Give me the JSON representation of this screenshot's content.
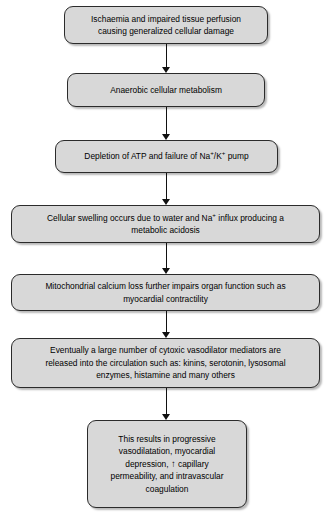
{
  "diagram": {
    "type": "vertical-flowchart",
    "orientation": "top-to-bottom",
    "box_fill_color": "#d8d8d8",
    "box_border_color": "#2b2b2b",
    "text_color": "#000000",
    "arrow_color": "#111111",
    "background_color": "#ffffff",
    "nodes": [
      {
        "id": "node-1",
        "text": "Ischaemia and impaired tissue perfusion\ncausing generalized cellular damage",
        "lines": 2
      },
      {
        "id": "node-2",
        "text": "Anaerobic cellular metabolism",
        "lines": 1
      },
      {
        "id": "node-3",
        "text_before": "Depletion of ATP and failure of Na",
        "sup_1": "+",
        "text_middle": "/K",
        "sup_2": "+",
        "text_after": " pump",
        "text": "Depletion of ATP and failure of Na+/K+ pump",
        "lines": 1
      },
      {
        "id": "node-4",
        "text_before": "Cellular swelling occurs due to water and Na",
        "sup_1": "+",
        "text_after": " influx producing a\nmetabolic acidosis",
        "text": "Cellular swelling occurs due to water and Na+ influx producing a metabolic acidosis",
        "lines": 2
      },
      {
        "id": "node-5",
        "text": "Mitochondrial calcium loss further impairs organ function such as\nmyocardial contractility",
        "lines": 2
      },
      {
        "id": "node-6",
        "text": "Eventually a large number of cytoxic vasodilator mediators are\nreleased into the circulation such as: kinins, serotonin, lysosomal\nenzymes, histamine and many others",
        "lines": 3
      },
      {
        "id": "node-7",
        "text_before": "This results in progressive\nvasodilatation, myocardial\ndepression, ",
        "arrow_glyph": "↑",
        "text_after": " capillary\npermeability, and intravascular\ncoagulation",
        "text": "This results in progressive vasodilatation, myocardial depression, ↑ capillary permeability, and intravascular coagulation",
        "lines": 5
      }
    ],
    "connectors": [
      {
        "id": "connector-1-2",
        "from": "node-1",
        "to": "node-2",
        "glyph": "↓"
      },
      {
        "id": "connector-2-3",
        "from": "node-2",
        "to": "node-3",
        "glyph": "↓"
      },
      {
        "id": "connector-3-4",
        "from": "node-3",
        "to": "node-4",
        "glyph": "↓"
      },
      {
        "id": "connector-4-5",
        "from": "node-4",
        "to": "node-5",
        "glyph": "↓"
      },
      {
        "id": "connector-5-6",
        "from": "node-5",
        "to": "node-6",
        "glyph": "↓"
      },
      {
        "id": "connector-6-7",
        "from": "node-6",
        "to": "node-7",
        "glyph": "↓"
      }
    ]
  }
}
